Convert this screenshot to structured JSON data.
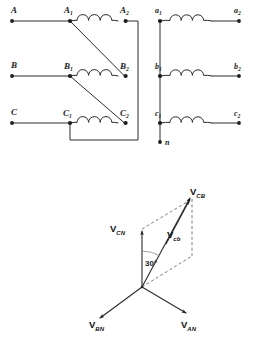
{
  "figure": {
    "type": "electrical-schematic-and-phasor-diagram",
    "background_color": "#ffffff",
    "line_color": "#2b2b2b",
    "dashed_color": "#6e6e6e"
  },
  "primary_circuit": {
    "name": "delta-connected-primary-winding",
    "line_terminals": [
      {
        "label": "A",
        "id": "terminal-a"
      },
      {
        "label": "B",
        "id": "terminal-b"
      },
      {
        "label": "C",
        "id": "terminal-c"
      }
    ],
    "coils": [
      {
        "start_label": "A",
        "start_sub": "1",
        "end_label": "A",
        "end_sub": "2"
      },
      {
        "start_label": "B",
        "start_sub": "1",
        "end_label": "B",
        "end_sub": "2"
      },
      {
        "start_label": "C",
        "start_sub": "1",
        "end_label": "C",
        "end_sub": "2"
      }
    ],
    "coil_humps": 3
  },
  "secondary_circuit": {
    "name": "wye-connected-secondary-winding",
    "coils": [
      {
        "start_label": "a",
        "start_sub": "1",
        "end_label": "a",
        "end_sub": "2"
      },
      {
        "start_label": "b",
        "start_sub": "1",
        "end_label": "b",
        "end_sub": "2"
      },
      {
        "start_label": "c",
        "start_sub": "1",
        "end_label": "c",
        "end_sub": "2"
      }
    ],
    "neutral": {
      "label": "n",
      "id": "neutral-terminal"
    },
    "coil_humps": 3
  },
  "phasor_diagram": {
    "name": "voltage-phasor-diagram",
    "angle_annotation": "30°",
    "phasors": [
      {
        "id": "phasor-cb",
        "base": "V",
        "sub": "CB",
        "style": "solid"
      },
      {
        "id": "phasor-cn",
        "base": "V",
        "sub": "CN",
        "style": "solid"
      },
      {
        "id": "phasor-cb-inner",
        "base": "V",
        "sub": "cb",
        "style": "solid"
      },
      {
        "id": "phasor-bn",
        "base": "V",
        "sub": "BN",
        "style": "solid"
      },
      {
        "id": "phasor-an",
        "base": "V",
        "sub": "AN",
        "style": "solid"
      }
    ],
    "construction_lines": "dashed-parallelogram"
  }
}
